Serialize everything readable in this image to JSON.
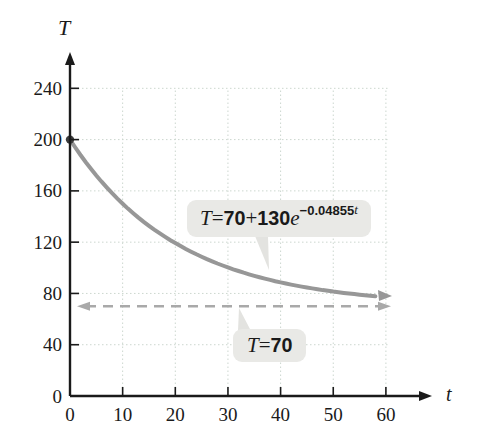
{
  "figure": {
    "background": "#ffffff"
  },
  "chart_data": {
    "type": "line",
    "title": "",
    "xlabel": "t",
    "ylabel": "T",
    "x_ticks": [
      0,
      10,
      20,
      30,
      40,
      50,
      60
    ],
    "y_ticks": [
      0,
      40,
      80,
      120,
      160,
      200,
      240
    ],
    "xlim": [
      0,
      68
    ],
    "ylim": [
      0,
      265
    ],
    "grid": true,
    "legend": "none",
    "series": [
      {
        "name": "cooling-curve",
        "equation": "T = 70 + 130e^(-0.04855t)",
        "params": {
          "ambient": 70,
          "coefficient": 130,
          "decay_rate": 0.04855
        },
        "t_domain": [
          0,
          60
        ],
        "sampled_points": [
          {
            "t": 0,
            "T": 200.0
          },
          {
            "t": 10,
            "T": 150.0
          },
          {
            "t": 20,
            "T": 119.2
          },
          {
            "t": 30,
            "T": 100.3
          },
          {
            "t": 40,
            "T": 88.6
          },
          {
            "t": 50,
            "T": 81.5
          },
          {
            "t": 60,
            "T": 77.1
          }
        ],
        "start_point": {
          "t": 0,
          "T": 200,
          "marker": "dot"
        },
        "end_marker": "arrow"
      }
    ],
    "asymptote": {
      "value": 70,
      "style": "dashed",
      "double_arrow": true
    }
  },
  "annotations": {
    "curve_label": {
      "text": "T = 70 + 130e−0.04855t",
      "parts": [
        {
          "t": "T",
          "s": "var"
        },
        {
          "t": " = ",
          "s": "plain"
        },
        {
          "t": "70",
          "s": "num"
        },
        {
          "t": " + ",
          "s": "plain"
        },
        {
          "t": "130",
          "s": "num"
        },
        {
          "t": "e",
          "s": "var"
        },
        {
          "t": "−0.04855",
          "s": "supnum"
        },
        {
          "t": "t",
          "s": "supvar"
        }
      ]
    },
    "asymptote_label": {
      "text": "T = 70",
      "parts": [
        {
          "t": "T",
          "s": "var"
        },
        {
          "t": " = ",
          "s": "plain"
        },
        {
          "t": "70",
          "s": "num"
        }
      ]
    }
  },
  "colors": {
    "axis": "#1a1a1a",
    "tick_text": "#1a1a1a",
    "grid": "#ccd7cf",
    "curve": "#979797",
    "asymptote": "#a9a9a9",
    "label_box_bg": "#e9e9e6",
    "callout_tail": "#e3e3e0",
    "start_dot": "#3d3d3d"
  }
}
